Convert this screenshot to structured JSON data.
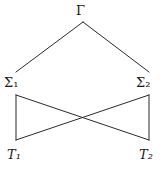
{
  "diagram": {
    "type": "lattice-hasse-diagram",
    "background_color": "#ffffff",
    "line_color": "#2b2b2b",
    "line_width": 1,
    "width": 166,
    "height": 169,
    "nodes": [
      {
        "id": "gamma",
        "base": "Γ",
        "subscript": "",
        "label": "Γ",
        "x": 83,
        "y": 10,
        "italic": false
      },
      {
        "id": "sigma1",
        "base": "Σ",
        "subscript": "1",
        "label": "Σ₁",
        "x": 15,
        "y": 83,
        "italic": false
      },
      {
        "id": "sigma2",
        "base": "Σ",
        "subscript": "2",
        "label": "Σ₂",
        "x": 150,
        "y": 83,
        "italic": false
      },
      {
        "id": "t1",
        "base": "T",
        "subscript": "1",
        "label": "T₁",
        "x": 16,
        "y": 155,
        "italic": true
      },
      {
        "id": "t2",
        "base": "T",
        "subscript": "2",
        "label": "T₂",
        "x": 150,
        "y": 155,
        "italic": true
      }
    ],
    "edges": [
      {
        "id": "gamma-sigma1",
        "from": "gamma",
        "to": "sigma1",
        "x1": 83,
        "y1": 22,
        "x2": 16,
        "y2": 72
      },
      {
        "id": "gamma-sigma2",
        "from": "gamma",
        "to": "sigma2",
        "x1": 83,
        "y1": 22,
        "x2": 149,
        "y2": 72
      },
      {
        "id": "sigma1-t1",
        "from": "sigma1",
        "to": "t1",
        "x1": 16,
        "y1": 95,
        "x2": 16,
        "y2": 140
      },
      {
        "id": "sigma2-t2",
        "from": "sigma2",
        "to": "t2",
        "x1": 149,
        "y1": 95,
        "x2": 149,
        "y2": 140
      },
      {
        "id": "sigma1-t2",
        "from": "sigma1",
        "to": "t2",
        "x1": 16,
        "y1": 95,
        "x2": 149,
        "y2": 140
      },
      {
        "id": "sigma2-t1",
        "from": "sigma2",
        "to": "t1",
        "x1": 149,
        "y1": 95,
        "x2": 16,
        "y2": 140
      }
    ],
    "crossing_point": {
      "x": 82,
      "y": 117
    }
  }
}
